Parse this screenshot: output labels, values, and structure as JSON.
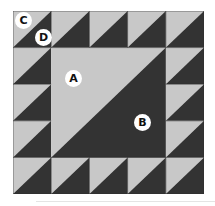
{
  "diagram": {
    "grid": {
      "rows": 5,
      "cols": 5
    },
    "colors": {
      "light": "#c8c8c8",
      "dark": "#333333",
      "seam": "#2e2e2e"
    },
    "pieces": {
      "A": "Large light triangle (center, upper-left half)",
      "B": "Large dark triangle (center, lower-right half)",
      "C": "Small light triangle (half-square unit, upper-left)",
      "D": "Small dark triangle (half-square unit, lower-right)"
    },
    "labels": [
      {
        "id": "C",
        "text": "C"
      },
      {
        "id": "D",
        "text": "D"
      },
      {
        "id": "A",
        "text": "A"
      },
      {
        "id": "B",
        "text": "B"
      }
    ]
  }
}
